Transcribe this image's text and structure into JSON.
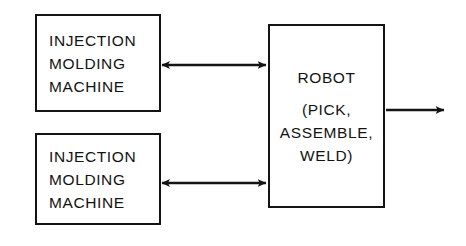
{
  "diagram": {
    "background_color": "#ffffff",
    "stroke_color": "#141414",
    "text_color": "#131313",
    "nodes": [
      {
        "id": "injection-molding-machine-top",
        "name": "Injection Molding Machine (upper)",
        "lines": [
          "INJECTION",
          "MOLDING",
          "MACHINE"
        ],
        "x": 35,
        "y": 14,
        "width": 126,
        "height": 98
      },
      {
        "id": "injection-molding-machine-bottom",
        "name": "Injection Molding Machine (lower)",
        "lines": [
          "INJECTION",
          "MOLDING",
          "MACHINE"
        ],
        "x": 35,
        "y": 133,
        "width": 126,
        "height": 92
      },
      {
        "id": "robot",
        "name": "Robot",
        "lines": [
          "ROBOT",
          "",
          "(PICK,",
          "ASSEMBLE,",
          "WELD)"
        ],
        "x": 268,
        "y": 24,
        "width": 117,
        "height": 184
      }
    ],
    "connectors": [
      {
        "id": "link-top",
        "name": "Bidirectional link between upper molding machine and robot",
        "from": "injection-molding-machine-top",
        "to": "robot",
        "arrowheads": "both",
        "x1": 161,
        "x2": 267,
        "y": 65
      },
      {
        "id": "link-bottom",
        "name": "Bidirectional link between lower molding machine and robot",
        "from": "injection-molding-machine-bottom",
        "to": "robot",
        "arrowheads": "both",
        "x1": 161,
        "x2": 267,
        "y": 183
      },
      {
        "id": "link-output",
        "name": "Robot output flow",
        "from": "robot",
        "to": "",
        "arrowheads": "end",
        "x1": 386,
        "x2": 446,
        "y": 110
      }
    ]
  }
}
